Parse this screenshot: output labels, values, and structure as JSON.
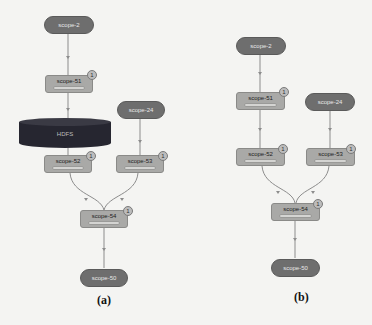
{
  "figure": {
    "panels": [
      {
        "id": "a",
        "caption": "(a)",
        "nodes": {
          "scope_2": {
            "label": "scope-2",
            "shape": "oval"
          },
          "scope_51": {
            "label": "scope-51",
            "shape": "box",
            "badge": "1"
          },
          "hdfs": {
            "label": "HDFS",
            "shape": "cylinder"
          },
          "scope_24": {
            "label": "scope-24",
            "shape": "oval"
          },
          "scope_52": {
            "label": "scope-52",
            "shape": "box",
            "badge": "1"
          },
          "scope_53": {
            "label": "scope-53",
            "shape": "box",
            "badge": "1"
          },
          "scope_54": {
            "label": "scope-54",
            "shape": "box",
            "badge": "1"
          },
          "scope_50": {
            "label": "scope-50",
            "shape": "oval"
          }
        },
        "edges": [
          [
            "scope-2",
            "scope-51"
          ],
          [
            "scope-51",
            "HDFS"
          ],
          [
            "HDFS",
            "scope-52"
          ],
          [
            "scope-24",
            "scope-53"
          ],
          [
            "scope-52",
            "scope-54"
          ],
          [
            "scope-53",
            "scope-54"
          ],
          [
            "scope-54",
            "scope-50"
          ]
        ]
      },
      {
        "id": "b",
        "caption": "(b)",
        "nodes": {
          "scope_2": {
            "label": "scope-2",
            "shape": "oval"
          },
          "scope_51": {
            "label": "scope-51",
            "shape": "box",
            "badge": "1"
          },
          "scope_24": {
            "label": "scope-24",
            "shape": "oval"
          },
          "scope_52": {
            "label": "scope-52",
            "shape": "box",
            "badge": "1"
          },
          "scope_53": {
            "label": "scope-53",
            "shape": "box",
            "badge": "1"
          },
          "scope_54": {
            "label": "scope-54",
            "shape": "box",
            "badge": "1"
          },
          "scope_50": {
            "label": "scope-50",
            "shape": "oval"
          }
        },
        "edges": [
          [
            "scope-2",
            "scope-51"
          ],
          [
            "scope-51",
            "scope-52"
          ],
          [
            "scope-24",
            "scope-53"
          ],
          [
            "scope-52",
            "scope-54"
          ],
          [
            "scope-53",
            "scope-54"
          ],
          [
            "scope-54",
            "scope-50"
          ]
        ]
      }
    ],
    "colors": {
      "oval_fill": "#6e6e6e",
      "box_fill": "#a9a9a7",
      "cylinder_fill": "#262630",
      "edge": "#8c8c8c",
      "background": "#f4f4f2"
    }
  }
}
